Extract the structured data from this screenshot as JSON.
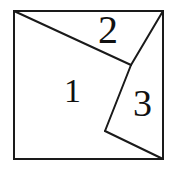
{
  "figure": {
    "background_color": "#ffffff",
    "stroke_color": "#1a1a1a",
    "stroke_width": 2,
    "canvas": {
      "width": 173,
      "height": 172
    },
    "square": {
      "name": "outer-square",
      "top_left": [
        14,
        11
      ],
      "top_right": [
        163,
        11
      ],
      "bottom_right": [
        163,
        159
      ],
      "bottom_left": [
        14,
        159
      ],
      "path": "M 14 11 L 163 11 L 163 159 L 14 159 Z"
    },
    "interior_vertices": {
      "junction": [
        131,
        65
      ],
      "lower_vertex": [
        105,
        131
      ]
    },
    "cut_lines": [
      {
        "name": "cut-top-left-diagonal",
        "from": [
          14,
          11
        ],
        "to": [
          131,
          65
        ],
        "path": "M 14 11 L 131 65"
      },
      {
        "name": "cut-junction-to-top-right",
        "from": [
          131,
          65
        ],
        "to": [
          163,
          11
        ],
        "path": "M 131 65 L 163 11"
      },
      {
        "name": "cut-junction-to-lower-vertex",
        "from": [
          131,
          65
        ],
        "to": [
          105,
          131
        ],
        "path": "M 131 65 L 105 131"
      },
      {
        "name": "cut-lower-vertex-to-bottom-right",
        "from": [
          105,
          131
        ],
        "to": [
          163,
          159
        ],
        "path": "M 105 131 L 163 159"
      }
    ],
    "regions": [
      {
        "id": "region-1",
        "label": "1",
        "description": "large left region",
        "label_position": [
          64,
          74
        ],
        "path": "M 14 11 L 131 65 L 105 131 L 163 159 L 14 159 Z"
      },
      {
        "id": "region-2",
        "label": "2",
        "description": "upper triangle",
        "label_position": [
          98,
          10
        ],
        "path": "M 14 11 L 163 11 L 131 65 Z"
      },
      {
        "id": "region-3",
        "label": "3",
        "description": "right triangle",
        "label_position": [
          133,
          84
        ],
        "path": "M 131 65 L 163 11 L 163 159 L 105 131 Z"
      }
    ]
  }
}
